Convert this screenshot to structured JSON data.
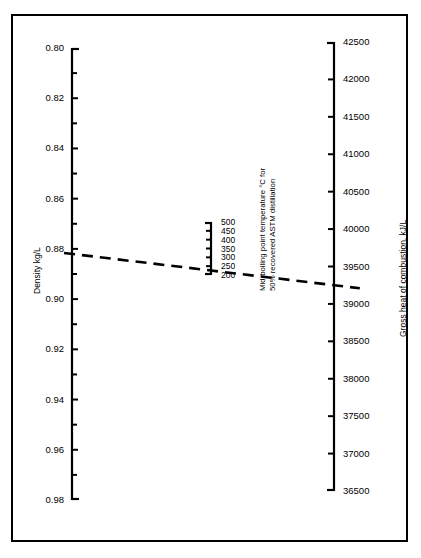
{
  "chart_data": {
    "type": "nomogram",
    "title": "",
    "axes": [
      {
        "id": "density",
        "label": "Density kg/L",
        "position": "left",
        "range": [
          0.8,
          0.98
        ],
        "orientation": "top-to-bottom-increasing",
        "major_ticks": [
          0.8,
          0.82,
          0.84,
          0.86,
          0.88,
          0.9,
          0.92,
          0.94,
          0.96,
          0.98
        ],
        "major_tick_labels": [
          "0.80",
          "0.82",
          "0.84",
          "0.86",
          "0.88",
          "0.90",
          "0.92",
          "0.94",
          "0.96",
          "0.98"
        ],
        "minor_ticks": [
          0.81,
          0.83,
          0.85,
          0.87,
          0.89,
          0.91,
          0.93,
          0.95,
          0.97
        ],
        "label_side": "left"
      },
      {
        "id": "mid-boiling-point",
        "label_line1": "Mid-boiling point temperature °C for",
        "label_line2": "50% recovered ASTM distillation",
        "position": "center",
        "range": [
          200,
          500
        ],
        "orientation": "top-to-bottom-decreasing",
        "major_ticks": [
          500,
          450,
          400,
          350,
          300,
          250,
          200
        ],
        "major_tick_labels": [
          "500",
          "450",
          "400",
          "350",
          "300",
          "250",
          "200"
        ],
        "minor_ticks": [],
        "label_side": "right"
      },
      {
        "id": "gross-heat-of-combustion",
        "label": "Gross heat of combustion, kJ/L",
        "position": "right",
        "range": [
          36500,
          42500
        ],
        "orientation": "top-to-bottom-decreasing",
        "major_ticks": [
          42500,
          42000,
          41500,
          41000,
          40500,
          40000,
          39500,
          39000,
          38500,
          38000,
          37500,
          37000,
          36500
        ],
        "major_tick_labels": [
          "42500",
          "42000",
          "41500",
          "41000",
          "40500",
          "40000",
          "39500",
          "39000",
          "38500",
          "38000",
          "37500",
          "37000",
          "36500"
        ],
        "minor_ticks": [],
        "label_side": "right"
      }
    ],
    "construction_line": {
      "style": "dashed",
      "color": "#000000",
      "points": [
        {
          "axis": "density",
          "value": 0.882
        },
        {
          "axis": "mid-boiling-point",
          "value": 255
        },
        {
          "axis": "gross-heat-of-combustion",
          "value": 39250
        }
      ],
      "description": "Dashed construction line connecting density 0.882 kg/L, mid-boiling point ~255 °C, and gross heat of combustion ~39250 kJ/L"
    },
    "grid": false,
    "legend": false
  },
  "figure": {
    "border_color": "#000000",
    "background": "#ffffff"
  }
}
